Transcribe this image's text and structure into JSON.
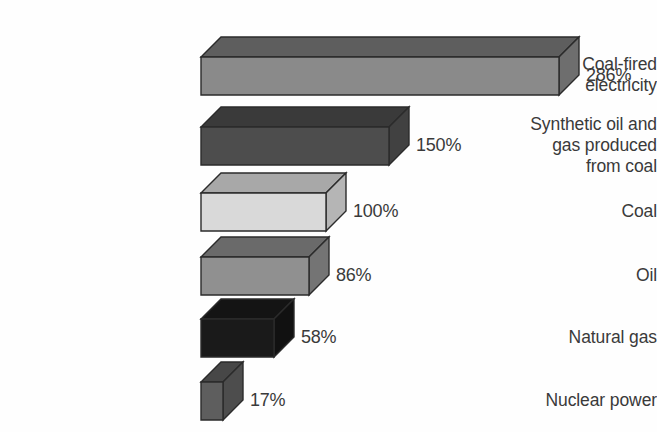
{
  "chart_data": {
    "type": "bar",
    "orientation": "horizontal",
    "title": "",
    "subtitle": "",
    "xlabel": "",
    "ylabel": "",
    "grid": false,
    "legend": "none",
    "axis_visible": false,
    "value_unit": "%",
    "xlim": [
      0,
      286
    ],
    "categories": [
      "Coal-fired\nelectricity",
      "Synthetic oil and\ngas produced\nfrom coal",
      "Coal",
      "Oil",
      "Natural gas",
      "Nuclear power"
    ],
    "values": [
      286,
      150,
      100,
      86,
      58,
      17
    ],
    "data_labels": [
      "286%",
      "150%",
      "100%",
      "86%",
      "58%",
      "17%"
    ],
    "bar_colors": [
      "#8a8a8a",
      "#4d4d4d",
      "#d9d9d9",
      "#909090",
      "#1a1a1a",
      "#5e5e5e"
    ],
    "bar_top_colors": [
      "#5e5e5e",
      "#3a3a3a",
      "#a8a8a8",
      "#6a6a6a",
      "#141414",
      "#474747"
    ],
    "bar_side_colors": [
      "#6e6e6e",
      "#414141",
      "#b5b5b5",
      "#747474",
      "#111111",
      "#4d4d4d"
    ],
    "outline_color": "#2b2b2b",
    "text_color": "#3a3a3a",
    "background_color": "#ffffff"
  },
  "chart": {
    "bars": [
      {
        "name": "coal-fired-electricity",
        "label": "Coal-fired\nelectricity",
        "value": 286,
        "value_label": "286%",
        "fill": "#8a8a8a",
        "top_fill": "#5e5e5e",
        "side_fill": "#6e6e6e",
        "top": 36,
        "bar_width": 358,
        "bar_height": 38
      },
      {
        "name": "synthetic-oil-and-gas-from-coal",
        "label": "Synthetic oil and\ngas produced\nfrom coal",
        "value": 150,
        "value_label": "150%",
        "fill": "#4d4d4d",
        "top_fill": "#3a3a3a",
        "side_fill": "#414141",
        "top": 106,
        "bar_width": 188,
        "bar_height": 38
      },
      {
        "name": "coal",
        "label": "Coal",
        "value": 100,
        "value_label": "100%",
        "fill": "#d9d9d9",
        "top_fill": "#a8a8a8",
        "side_fill": "#b5b5b5",
        "top": 172,
        "bar_width": 125,
        "bar_height": 38
      },
      {
        "name": "oil",
        "label": "Oil",
        "value": 86,
        "value_label": "86%",
        "fill": "#909090",
        "top_fill": "#6a6a6a",
        "side_fill": "#747474",
        "top": 236,
        "bar_width": 108,
        "bar_height": 38
      },
      {
        "name": "natural-gas",
        "label": "Natural gas",
        "value": 58,
        "value_label": "58%",
        "fill": "#1a1a1a",
        "top_fill": "#141414",
        "side_fill": "#111111",
        "top": 298,
        "bar_width": 73,
        "bar_height": 38
      },
      {
        "name": "nuclear-power",
        "label": "Nuclear power",
        "value": 17,
        "value_label": "17%",
        "fill": "#5e5e5e",
        "top_fill": "#474747",
        "side_fill": "#4d4d4d",
        "top": 361,
        "bar_width": 22,
        "bar_height": 38
      }
    ],
    "depth_x": 20,
    "depth_y": 20,
    "bar_origin_x": 200,
    "label_gap": 8
  }
}
